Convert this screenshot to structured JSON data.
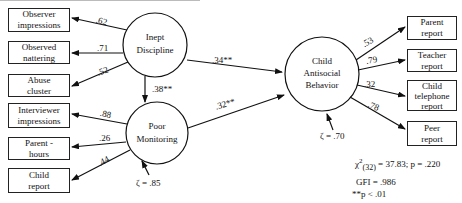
{
  "indicators_left": [
    {
      "id": "observer-impressions",
      "label_lines": [
        "Observer",
        "impressions"
      ],
      "loading": ".62"
    },
    {
      "id": "observed-nattering",
      "label_lines": [
        "Observed",
        "nattering"
      ],
      "loading": ".71"
    },
    {
      "id": "abuse-cluster",
      "label_lines": [
        "Abuse",
        "cluster"
      ],
      "loading": ".52"
    },
    {
      "id": "interviewer-impressions",
      "label_lines": [
        "Interviewer",
        "impressions"
      ],
      "loading": ".88"
    },
    {
      "id": "parent-hours",
      "label_lines": [
        "Parent -",
        "hours"
      ],
      "loading": ".26"
    },
    {
      "id": "child-report",
      "label_lines": [
        "Child",
        "report"
      ],
      "loading": ".44"
    }
  ],
  "indicators_right": [
    {
      "id": "parent-report",
      "label_lines": [
        "Parent",
        "report"
      ],
      "loading": ".53"
    },
    {
      "id": "teacher-report",
      "label_lines": [
        "Teacher",
        "report"
      ],
      "loading": ".79"
    },
    {
      "id": "child-telephone-report",
      "label_lines": [
        "Child",
        "telephone",
        "report"
      ],
      "loading": ".32"
    },
    {
      "id": "peer-report",
      "label_lines": [
        "Peer",
        "report"
      ],
      "loading": ".78"
    }
  ],
  "latent": {
    "inept_discipline": {
      "lines": [
        "Inept",
        "Discipline"
      ]
    },
    "poor_monitoring": {
      "lines": [
        "Poor",
        "Monitoring"
      ],
      "zeta": "ζ = .85"
    },
    "child_antisocial": {
      "lines": [
        "Child",
        "Antisocial",
        "Behavior"
      ],
      "zeta": "ζ = .70"
    }
  },
  "paths": {
    "discipline_to_monitoring": ".38**",
    "discipline_to_antisocial": ".34**",
    "monitoring_to_antisocial": ".32**"
  },
  "fit": {
    "chi_symbol": "χ",
    "chi_sup": "2",
    "chi_sub": "(32)",
    "chi_value": "= 37.83; p = .220",
    "gfi": "GFI = .986",
    "note": "**p < .01"
  }
}
